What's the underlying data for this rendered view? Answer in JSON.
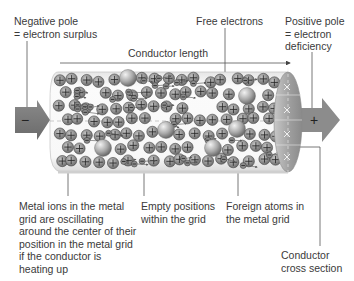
{
  "diagram": {
    "type": "conductor-cross-section",
    "labels": {
      "negative_pole": "Negative pole\n= electron surplus",
      "conductor_length": "Conductor length",
      "free_electrons": "Free electrons",
      "positive_pole": "Positive pole\n= electron\ndeficiency",
      "metal_ions": "Metal ions in the metal\ngrid are oscillating\naround the center of their\nposition in the metal grid\nif the conductor is\nheating up",
      "empty_positions": "Empty positions\nwithin the grid",
      "foreign_atoms": "Foreign atoms in\nthe metal grid",
      "cross_section": "Conductor\ncross section"
    },
    "symbols": {
      "minus": "−",
      "plus": "+"
    },
    "colors": {
      "arrow_fill": "#7a7a7a",
      "ion_fill": "#8a8a8a",
      "conductor_bg": "#f4f4f4",
      "cross_section": "#9a9a9a"
    }
  }
}
